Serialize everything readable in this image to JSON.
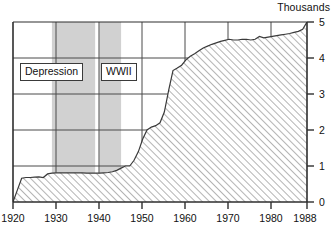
{
  "chart_data": {
    "type": "area",
    "title": "",
    "subtitle": "",
    "unit_label": "Thousands",
    "xlabel": "",
    "ylabel": "",
    "xlim": [
      1920,
      1988
    ],
    "ylim": [
      0,
      5
    ],
    "ytick_labels": [
      "0",
      "1",
      "2",
      "3",
      "4",
      "5"
    ],
    "ytick_values": [
      0,
      1,
      2,
      3,
      4,
      5
    ],
    "xtick_labels": [
      "1920",
      "1930",
      "1940",
      "1950",
      "1960",
      "1970",
      "1980",
      "1988"
    ],
    "xtick_values": [
      1920,
      1930,
      1940,
      1950,
      1960,
      1970,
      1980,
      1988
    ],
    "grid": true,
    "grid_axis": "y",
    "legend_position": "none",
    "fill_pattern": "diagonal-hatch",
    "series": [
      {
        "name": "Thousands",
        "x": [
          1920,
          1921,
          1922,
          1923,
          1924,
          1925,
          1926,
          1927,
          1928,
          1929,
          1930,
          1931,
          1932,
          1933,
          1934,
          1935,
          1936,
          1937,
          1938,
          1939,
          1940,
          1941,
          1942,
          1943,
          1944,
          1945,
          1946,
          1947,
          1948,
          1949,
          1950,
          1951,
          1952,
          1953,
          1954,
          1955,
          1956,
          1957,
          1958,
          1959,
          1960,
          1961,
          1962,
          1963,
          1964,
          1965,
          1966,
          1967,
          1968,
          1969,
          1970,
          1971,
          1972,
          1973,
          1974,
          1975,
          1976,
          1977,
          1978,
          1979,
          1980,
          1981,
          1982,
          1983,
          1984,
          1985,
          1986,
          1987,
          1988
        ],
        "y": [
          0.0,
          0.33,
          0.66,
          0.68,
          0.68,
          0.69,
          0.7,
          0.68,
          0.78,
          0.8,
          0.81,
          0.81,
          0.81,
          0.81,
          0.81,
          0.81,
          0.81,
          0.8,
          0.8,
          0.8,
          0.8,
          0.81,
          0.82,
          0.84,
          0.88,
          0.94,
          1.0,
          1.0,
          1.16,
          1.4,
          1.75,
          2.0,
          2.08,
          2.12,
          2.2,
          2.5,
          3.1,
          3.65,
          3.72,
          3.8,
          3.95,
          4.05,
          4.12,
          4.2,
          4.28,
          4.33,
          4.38,
          4.42,
          4.46,
          4.49,
          4.52,
          4.5,
          4.5,
          4.52,
          4.52,
          4.5,
          4.52,
          4.6,
          4.56,
          4.58,
          4.6,
          4.62,
          4.64,
          4.66,
          4.68,
          4.71,
          4.74,
          4.8,
          5.0
        ]
      }
    ],
    "annotations": [
      {
        "id": "depression",
        "label": "Depression",
        "type": "shaded-band-label",
        "band_start": 1929,
        "band_end": 1939
      },
      {
        "id": "wwii",
        "label": "WWII",
        "type": "shaded-band-label",
        "band_start": 1940,
        "band_end": 1945
      }
    ],
    "shaded_bands": [
      {
        "label": "Depression",
        "start": 1929,
        "end": 1939
      },
      {
        "label": "WWII",
        "start": 1940,
        "end": 1945
      }
    ],
    "colors": {
      "axis": "#2e2e2e",
      "grid": "#4a4a4a",
      "hatch": "#9b9b9b",
      "band_fill": "#c9c9c9",
      "text": "#111111",
      "background": "#ffffff"
    }
  }
}
